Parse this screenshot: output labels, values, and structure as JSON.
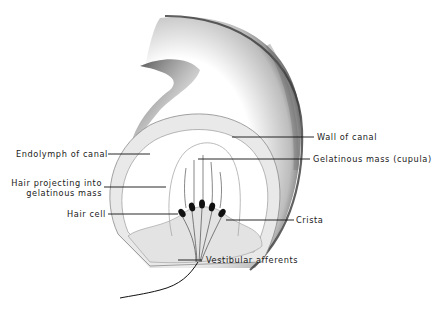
{
  "diagram": {
    "labels": {
      "wall_of_canal": "Wall of canal",
      "endolymph_of_canal": "Endolymph of canal",
      "gelatinous_mass": "Gelatinous mass (cupula)",
      "hair_projecting_line1": "Hair projecting into",
      "hair_projecting_line2": "gelatinous mass",
      "hair_cell": "Hair cell",
      "crista": "Crista",
      "vestibular_afferents": "Vestibular afferents"
    },
    "colors": {
      "ink": "#1a1a1a",
      "shading": "#555555",
      "wall_fill": "#e9e9e9",
      "background": "#ffffff"
    }
  }
}
